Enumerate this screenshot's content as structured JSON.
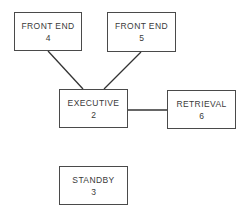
{
  "diagram": {
    "type": "block-diagram",
    "colors": {
      "line": "#333333",
      "border": "#4a4a4a",
      "text": "#3a3a3a",
      "background": "#ffffff"
    },
    "nodes": [
      {
        "id": "fe4",
        "label": "FRONT END",
        "number": "4",
        "x": 14,
        "y": 12,
        "w": 68,
        "h": 39
      },
      {
        "id": "fe5",
        "label": "FRONT END",
        "number": "5",
        "x": 107,
        "y": 12,
        "w": 69,
        "h": 40
      },
      {
        "id": "exec",
        "label": "EXECUTIVE",
        "number": "2",
        "x": 59,
        "y": 89,
        "w": 69,
        "h": 39
      },
      {
        "id": "ret",
        "label": "RETRIEVAL",
        "number": "6",
        "x": 167,
        "y": 90,
        "w": 69,
        "h": 39
      },
      {
        "id": "stby",
        "label": "STANDBY",
        "number": "3",
        "x": 59,
        "y": 166,
        "w": 69,
        "h": 39
      }
    ],
    "edges": [
      {
        "from": "fe4",
        "to": "exec",
        "x1": 48,
        "y1": 51,
        "x2": 83,
        "y2": 89
      },
      {
        "from": "fe5",
        "to": "exec",
        "x1": 141,
        "y1": 52,
        "x2": 104,
        "y2": 89
      },
      {
        "from": "exec",
        "to": "ret",
        "x1": 128,
        "y1": 110,
        "x2": 167,
        "y2": 110
      }
    ]
  }
}
